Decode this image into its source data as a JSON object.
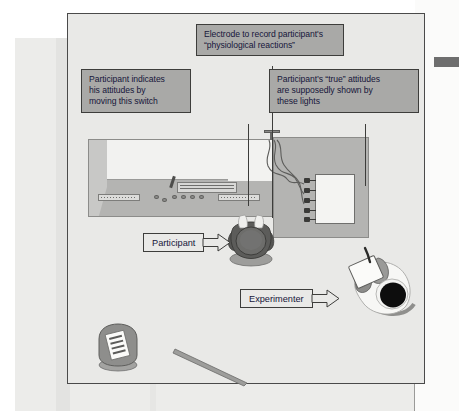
{
  "figure": {
    "scene_description": "Overhead diagram of a psychology laboratory showing a participant seated at a console, an experimenter with a clipboard, a lights display and an electrode rig."
  },
  "callouts": [
    {
      "id": "electrode",
      "name": "callout-electrode",
      "lines": [
        "Electrode to record participant's",
        "“physiological reactions”"
      ]
    },
    {
      "id": "switch",
      "name": "callout-switch",
      "lines": [
        "Participant indicates",
        "his attitudes by",
        "moving this switch"
      ]
    },
    {
      "id": "lights",
      "name": "callout-lights",
      "lines": [
        "Participant’s “true” attitudes",
        "are supposedly shown by",
        "these lights"
      ]
    }
  ],
  "arrow_labels": [
    {
      "id": "participant",
      "label": "Participant"
    },
    {
      "id": "experimenter",
      "label": "Experimenter"
    }
  ],
  "scene_objects": [
    {
      "name": "console-desk",
      "label": "console desk"
    },
    {
      "name": "lights-box",
      "label": "lights display panel"
    },
    {
      "name": "electrode-post",
      "label": "electrode rig"
    },
    {
      "name": "participant-figure",
      "label": "participant"
    },
    {
      "name": "experimenter-figure",
      "label": "experimenter"
    },
    {
      "name": "chair",
      "label": "chair with questionnaire"
    },
    {
      "name": "pole",
      "label": "pole on floor"
    }
  ],
  "colors": {
    "callout_fill": "#a9a9a7",
    "callout_border": "#3d3d3b",
    "callout_text": "#16163a",
    "room_floor": "#e9e9e7",
    "console_body": "#b4b4b2",
    "console_top": "#f2f2f0",
    "frame_border": "#4a4a4a",
    "page_background": "#ececea",
    "header_bar": "#6e6e6e",
    "lab_coat": "#f7f7f5",
    "hair": "#101010"
  }
}
